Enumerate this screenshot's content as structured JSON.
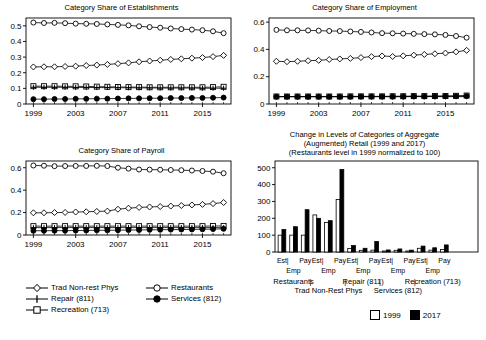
{
  "figure": {
    "background": "#ffffff",
    "foreground": "#000000"
  },
  "legend": {
    "items": [
      {
        "label": "Trad Non-rest Phys",
        "marker": "diamond-open-icon"
      },
      {
        "label": "Restaurants",
        "marker": "circle-open-icon"
      },
      {
        "label": "Repair (811)",
        "marker": "plus-icon"
      },
      {
        "label": "Services (812)",
        "marker": "circle-filled-icon"
      },
      {
        "label": "Recreation (713)",
        "marker": "square-open-icon"
      }
    ]
  },
  "bar_legend": {
    "items": [
      {
        "label": "1999",
        "swatch": "open-square-icon"
      },
      {
        "label": "2017",
        "swatch": "filled-square-icon"
      }
    ]
  },
  "chart_data": [
    {
      "id": "establishments",
      "type": "line",
      "title": "Category Share of Establishments",
      "xlabel": "",
      "ylabel": "",
      "xlim": [
        1998.3,
        2017.7
      ],
      "ylim": [
        0,
        0.55
      ],
      "yticks": [
        0,
        0.1,
        0.2,
        0.3,
        0.4,
        0.5
      ],
      "ytick_labels": [
        "0",
        "0.1",
        "0.2",
        "0.3",
        "0.4",
        "0.5"
      ],
      "xticks": [
        1999,
        2003,
        2007,
        2011,
        2015
      ],
      "xtick_labels": [
        "1999",
        "2003",
        "2007",
        "2011",
        "2015"
      ],
      "grid": false,
      "legend_position": "below-figure",
      "x": [
        1999,
        2000,
        2001,
        2002,
        2003,
        2004,
        2005,
        2006,
        2007,
        2008,
        2009,
        2010,
        2011,
        2012,
        2013,
        2014,
        2015,
        2016,
        2017
      ],
      "series": [
        {
          "name": "Restaurants",
          "marker": "circle-open",
          "values": [
            0.521,
            0.518,
            0.519,
            0.517,
            0.514,
            0.513,
            0.512,
            0.509,
            0.506,
            0.503,
            0.497,
            0.492,
            0.488,
            0.483,
            0.479,
            0.476,
            0.472,
            0.465,
            0.453
          ]
        },
        {
          "name": "Trad Non-rest Phys",
          "marker": "diamond-open",
          "values": [
            0.237,
            0.238,
            0.238,
            0.24,
            0.242,
            0.246,
            0.249,
            0.253,
            0.258,
            0.263,
            0.27,
            0.275,
            0.28,
            0.285,
            0.289,
            0.293,
            0.297,
            0.303,
            0.311
          ]
        },
        {
          "name": "Recreation (713)",
          "marker": "square-open",
          "values": [
            0.114,
            0.114,
            0.114,
            0.113,
            0.113,
            0.112,
            0.111,
            0.11,
            0.109,
            0.108,
            0.108,
            0.107,
            0.107,
            0.107,
            0.107,
            0.107,
            0.107,
            0.108,
            0.11
          ]
        },
        {
          "name": "Repair (811)",
          "marker": "plus",
          "values": [
            0.107,
            0.107,
            0.107,
            0.107,
            0.106,
            0.106,
            0.105,
            0.105,
            0.104,
            0.104,
            0.103,
            0.103,
            0.102,
            0.102,
            0.102,
            0.102,
            0.101,
            0.101,
            0.101
          ]
        },
        {
          "name": "Services (812)",
          "marker": "circle-filled",
          "values": [
            0.031,
            0.031,
            0.032,
            0.032,
            0.033,
            0.033,
            0.034,
            0.034,
            0.035,
            0.036,
            0.036,
            0.037,
            0.037,
            0.038,
            0.038,
            0.039,
            0.039,
            0.04,
            0.041
          ]
        }
      ]
    },
    {
      "id": "employment",
      "type": "line",
      "title": "Category Share of Employment",
      "xlabel": "",
      "ylabel": "",
      "xlim": [
        1998.3,
        2017.7
      ],
      "ylim": [
        0,
        0.63
      ],
      "yticks": [
        0,
        0.2,
        0.4,
        0.6
      ],
      "ytick_labels": [
        "0",
        "0.2",
        "0.4",
        "0.6"
      ],
      "xticks": [
        1999,
        2003,
        2007,
        2011,
        2015
      ],
      "xtick_labels": [
        "1999",
        "2003",
        "2007",
        "2011",
        "2015"
      ],
      "grid": false,
      "legend_position": "shared",
      "x": [
        1999,
        2000,
        2001,
        2002,
        2003,
        2004,
        2005,
        2006,
        2007,
        2008,
        2009,
        2010,
        2011,
        2012,
        2013,
        2014,
        2015,
        2016,
        2017
      ],
      "series": [
        {
          "name": "Restaurants",
          "marker": "circle-open",
          "values": [
            0.543,
            0.54,
            0.54,
            0.539,
            0.537,
            0.535,
            0.534,
            0.531,
            0.528,
            0.524,
            0.519,
            0.518,
            0.516,
            0.514,
            0.512,
            0.51,
            0.506,
            0.498,
            0.486
          ]
        },
        {
          "name": "Trad Non-rest Phys",
          "marker": "diamond-open",
          "values": [
            0.313,
            0.31,
            0.313,
            0.317,
            0.32,
            0.326,
            0.33,
            0.334,
            0.34,
            0.347,
            0.352,
            0.348,
            0.353,
            0.358,
            0.363,
            0.368,
            0.373,
            0.382,
            0.393
          ]
        },
        {
          "name": "Recreation (713)",
          "marker": "square-open",
          "values": [
            0.055,
            0.055,
            0.055,
            0.055,
            0.055,
            0.055,
            0.055,
            0.056,
            0.056,
            0.056,
            0.056,
            0.057,
            0.057,
            0.058,
            0.058,
            0.059,
            0.059,
            0.06,
            0.062
          ]
        },
        {
          "name": "Repair (811)",
          "marker": "plus",
          "values": [
            0.054,
            0.054,
            0.054,
            0.054,
            0.054,
            0.054,
            0.054,
            0.054,
            0.054,
            0.054,
            0.054,
            0.054,
            0.054,
            0.054,
            0.054,
            0.054,
            0.054,
            0.054,
            0.054
          ]
        },
        {
          "name": "Services (812)",
          "marker": "circle-filled",
          "values": [
            0.053,
            0.053,
            0.053,
            0.053,
            0.053,
            0.053,
            0.053,
            0.053,
            0.054,
            0.054,
            0.054,
            0.054,
            0.054,
            0.055,
            0.055,
            0.055,
            0.056,
            0.057,
            0.058
          ]
        }
      ]
    },
    {
      "id": "payroll",
      "type": "line",
      "title": "Category Share of Payroll",
      "xlabel": "",
      "ylabel": "",
      "xlim": [
        1998.3,
        2017.7
      ],
      "ylim": [
        0,
        0.66
      ],
      "yticks": [
        0,
        0.2,
        0.4,
        0.6
      ],
      "ytick_labels": [
        "0",
        "0.2",
        "0.4",
        "0.6"
      ],
      "xticks": [
        1999,
        2003,
        2007,
        2011,
        2015
      ],
      "xtick_labels": [
        "1999",
        "2003",
        "2007",
        "2011",
        "2015"
      ],
      "grid": false,
      "legend_position": "shared",
      "x": [
        1999,
        2000,
        2001,
        2002,
        2003,
        2004,
        2005,
        2006,
        2007,
        2008,
        2009,
        2010,
        2011,
        2012,
        2013,
        2014,
        2015,
        2016,
        2017
      ],
      "series": [
        {
          "name": "Restaurants",
          "marker": "circle-open",
          "values": [
            0.62,
            0.618,
            0.614,
            0.615,
            0.616,
            0.616,
            0.617,
            0.615,
            0.6,
            0.592,
            0.584,
            0.583,
            0.582,
            0.58,
            0.578,
            0.575,
            0.571,
            0.565,
            0.551
          ]
        },
        {
          "name": "Trad Non-rest Phys",
          "marker": "diamond-open",
          "values": [
            0.198,
            0.198,
            0.2,
            0.201,
            0.205,
            0.207,
            0.21,
            0.213,
            0.23,
            0.239,
            0.246,
            0.25,
            0.254,
            0.258,
            0.263,
            0.268,
            0.273,
            0.28,
            0.29
          ]
        },
        {
          "name": "Recreation (713)",
          "marker": "square-open",
          "values": [
            0.079,
            0.079,
            0.079,
            0.079,
            0.079,
            0.079,
            0.079,
            0.079,
            0.079,
            0.079,
            0.079,
            0.079,
            0.079,
            0.079,
            0.079,
            0.079,
            0.079,
            0.08,
            0.081
          ]
        },
        {
          "name": "Repair (811)",
          "marker": "plus",
          "values": [
            0.066,
            0.066,
            0.066,
            0.066,
            0.066,
            0.066,
            0.066,
            0.066,
            0.066,
            0.066,
            0.066,
            0.066,
            0.066,
            0.066,
            0.066,
            0.066,
            0.066,
            0.066,
            0.066
          ]
        },
        {
          "name": "Services (812)",
          "marker": "circle-filled",
          "values": [
            0.038,
            0.038,
            0.039,
            0.039,
            0.04,
            0.041,
            0.042,
            0.042,
            0.043,
            0.044,
            0.045,
            0.046,
            0.047,
            0.048,
            0.049,
            0.05,
            0.051,
            0.053,
            0.055
          ]
        }
      ]
    },
    {
      "id": "levels-change",
      "type": "bar",
      "title": "Change in Levels of Categories of Aggregate (Augmented) Retail (1999 and 2017) (Restaurants level in 1999 normalized to 100)",
      "title_lines": [
        "Change in Levels of Categories of Aggregate",
        "(Augmented) Retail (1999 and 2017)",
        "(Restaurants level in 1999 normalized to 100)"
      ],
      "xlabel": "",
      "ylabel": "",
      "ylim": [
        0,
        540
      ],
      "yticks": [
        0,
        100,
        200,
        300,
        400,
        500
      ],
      "ytick_labels": [
        "0",
        "100",
        "200",
        "300",
        "400",
        "500"
      ],
      "grid": false,
      "legend_position": "bottom-right",
      "measure_labels": [
        "Est",
        "Emp",
        "Pay"
      ],
      "group_labels": [
        "Restaurants",
        "Trad Non-Rest Phys",
        "Repair (811)",
        "Services (812)",
        "Recreation (713)"
      ],
      "categories": [
        "Restaurants Est",
        "Restaurants Emp",
        "Restaurants Pay",
        "Trad Non-Rest Phys Est",
        "Trad Non-Rest Phys Emp",
        "Trad Non-Rest Phys Pay",
        "Repair (811) Est",
        "Repair (811) Emp",
        "Repair (811) Pay",
        "Services (812) Est",
        "Services (812) Emp",
        "Services (812) Pay",
        "Recreation (713) Est",
        "Recreation (713) Emp",
        "Recreation (713) Pay"
      ],
      "series": [
        {
          "name": "1999",
          "fill": "open",
          "values": [
            100,
            100,
            100,
            220,
            175,
            312,
            21,
            10,
            11,
            6,
            10,
            6,
            22,
            11,
            15
          ]
        },
        {
          "name": "2017",
          "fill": "filled",
          "values": [
            133,
            150,
            251,
            200,
            186,
            489,
            38,
            22,
            62,
            12,
            18,
            11,
            35,
            25,
            42
          ]
        }
      ]
    }
  ]
}
